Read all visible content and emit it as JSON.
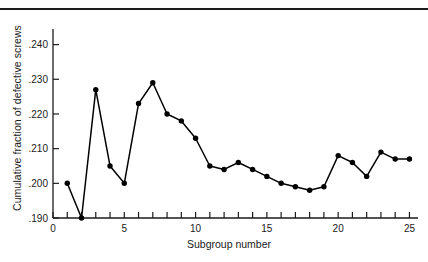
{
  "figure": {
    "top_rule": true,
    "axis_color": "#1b1b1b",
    "line_color": "#000000",
    "marker_color": "#000000",
    "background": "#ffffff"
  },
  "chart_data": {
    "type": "line",
    "title": "",
    "xlabel": "Subgroup number",
    "ylabel": "Cumulative fraction of defective screws",
    "x": [
      1,
      2,
      3,
      4,
      5,
      6,
      7,
      8,
      9,
      10,
      11,
      12,
      13,
      14,
      15,
      16,
      17,
      18,
      19,
      20,
      21,
      22,
      23,
      24,
      25
    ],
    "values": [
      0.2,
      0.19,
      0.227,
      0.205,
      0.2,
      0.223,
      0.229,
      0.22,
      0.218,
      0.213,
      0.205,
      0.204,
      0.206,
      0.204,
      0.202,
      0.2,
      0.199,
      0.198,
      0.199,
      0.208,
      0.206,
      0.202,
      0.209,
      0.207,
      0.207
    ],
    "xlim": [
      0,
      25.6
    ],
    "ylim": [
      0.19,
      0.2445
    ],
    "xticks": [
      0,
      1,
      2,
      3,
      4,
      5,
      6,
      7,
      8,
      9,
      10,
      11,
      12,
      13,
      14,
      15,
      16,
      17,
      18,
      19,
      20,
      21,
      22,
      23,
      24,
      25
    ],
    "xtick_labels_shown": [
      {
        "value": 0,
        "label": "0"
      },
      {
        "value": 5,
        "label": "5"
      },
      {
        "value": 10,
        "label": "10"
      },
      {
        "value": 15,
        "label": "15"
      },
      {
        "value": 20,
        "label": "20"
      },
      {
        "value": 25,
        "label": "25"
      }
    ],
    "yticks": [
      0.19,
      0.2,
      0.21,
      0.22,
      0.23,
      0.24
    ],
    "ytick_labels": [
      ".190",
      ".200",
      ".210",
      ".220",
      ".230",
      ".240"
    ],
    "grid": false,
    "legend": null,
    "marker": "filled-circle"
  }
}
